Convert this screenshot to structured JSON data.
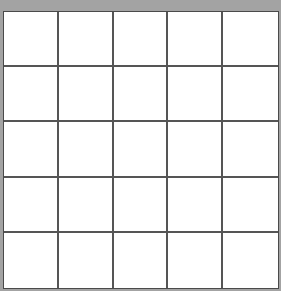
{
  "board": {
    "rows": 5,
    "cols": 5,
    "colors": {
      "background": "#a3a3a3",
      "cell": "#ffffff",
      "grid_line": "#555555"
    },
    "cells": [
      [
        "",
        "",
        "",
        "",
        ""
      ],
      [
        "",
        "",
        "",
        "",
        ""
      ],
      [
        "",
        "",
        "",
        "",
        ""
      ],
      [
        "",
        "",
        "",
        "",
        ""
      ],
      [
        "",
        "",
        "",
        "",
        ""
      ]
    ]
  }
}
